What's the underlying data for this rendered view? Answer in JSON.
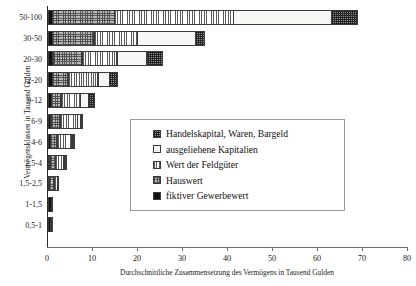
{
  "chart_data": {
    "type": "bar",
    "orientation": "horizontal",
    "stacked": true,
    "title": "",
    "xlabel": "Durchschnittliche Zusammensetzung des Vermögens in Tausend Gulden",
    "ylabel": "Vermögensklassen in Tausend Gulden",
    "xlim": [
      0,
      80
    ],
    "xticks": [
      0,
      10,
      20,
      30,
      40,
      50,
      60,
      70,
      80
    ],
    "grid": false,
    "legend_position": "center",
    "categories": [
      "50-100",
      "30-50",
      "20-30",
      "12-20",
      "9-12",
      "6-9",
      "4-6",
      "2,5-4",
      "1,5-2,5",
      "1-1,5",
      "0,5-1"
    ],
    "series": [
      {
        "name": "fiktiver Gewerbewert",
        "pattern": "solid-black",
        "values": [
          1.0,
          1.0,
          1.2,
          1.1,
          0.8,
          0.7,
          0.6,
          0.5,
          0.4,
          0.9,
          0.7
        ]
      },
      {
        "name": "Hauswert",
        "pattern": "dotted-grey",
        "values": [
          14.0,
          9.4,
          6.6,
          3.5,
          2.3,
          2.2,
          1.6,
          1.4,
          1.1,
          0.3,
          0.1
        ]
      },
      {
        "name": "Wert der Feldgüter",
        "pattern": "vertical-lines",
        "values": [
          26.5,
          9.8,
          7.9,
          6.8,
          4.5,
          4.0,
          3.4,
          1.9,
          0.9,
          0.0,
          0.0
        ]
      },
      {
        "name": "ausgeliehene Kapitalien",
        "pattern": "empty-white",
        "values": [
          22.0,
          13.1,
          6.8,
          2.7,
          1.9,
          0.9,
          0.3,
          0.1,
          0.0,
          0.0,
          0.0
        ]
      },
      {
        "name": "Handelskapital, Waren, Bargeld",
        "pattern": "cross-hatch",
        "values": [
          6.0,
          2.2,
          3.7,
          1.9,
          1.5,
          0.6,
          0.4,
          0.3,
          0.1,
          0.0,
          0.0
        ]
      }
    ],
    "totals": [
      69.5,
      35.5,
      26.2,
      16.0,
      11.0,
      8.4,
      6.3,
      4.2,
      2.5,
      1.2,
      0.8
    ]
  },
  "axis": {
    "x_tick_labels": [
      "0",
      "10",
      "20",
      "30",
      "40",
      "50",
      "60",
      "70",
      "80"
    ],
    "x_title": "Durchschnittliche Zusammensetzung des Vermögens in Tausend Gulden",
    "y_title": "Vermögensklassen in Tausend Gulden",
    "y_tick_labels": [
      "50-100",
      "30-50",
      "20-30",
      "12-20",
      "9-12",
      "6-9",
      "4-6",
      "2,5-4",
      "1,5-2,5",
      "1-1,5",
      "0,5-1"
    ]
  },
  "legend": {
    "items": [
      {
        "label": "Handelskapital, Waren, Bargeld",
        "pattern": "cross-hatch"
      },
      {
        "label": "ausgeliehene Kapitalien",
        "pattern": "empty-white"
      },
      {
        "label": "Wert der Feldgüter",
        "pattern": "vertical-lines"
      },
      {
        "label": "Hauswert",
        "pattern": "dotted-grey"
      },
      {
        "label": "fiktiver Gewerbewert",
        "pattern": "solid-black"
      }
    ]
  },
  "colors": {
    "axis": "#6f6f6f",
    "text": "#111111",
    "black_fill": "#111111",
    "grey_fill": "#b9b9b9",
    "white_fill": "#f7f7f5",
    "hatch_fill": "#8d8d8d"
  }
}
